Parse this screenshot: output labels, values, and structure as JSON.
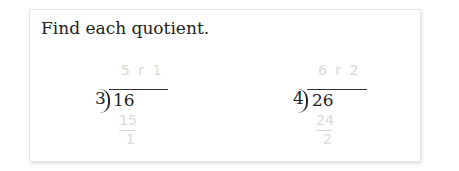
{
  "instruction": "Find each quotient.",
  "problems": [
    {
      "divisor": "3",
      "dividend": "16",
      "answer": "5 r 1",
      "product": "15",
      "remainder": "1"
    },
    {
      "divisor": "4",
      "dividend": "26",
      "answer": "6 r 2",
      "product": "24",
      "remainder": "2"
    }
  ]
}
